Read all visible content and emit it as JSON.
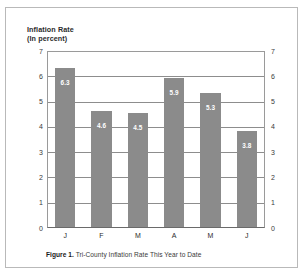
{
  "chart_data": {
    "type": "bar",
    "title": "Inflation Rate",
    "subtitle": "(In percent)",
    "categories": [
      "J",
      "F",
      "M",
      "A",
      "M",
      "J"
    ],
    "values": [
      6.3,
      4.6,
      4.5,
      5.9,
      5.3,
      3.8
    ],
    "value_labels": [
      "6.3",
      "4.6",
      "4.5",
      "5.9",
      "5.3",
      "3.8"
    ],
    "xlabel": "",
    "ylabel": "Inflation Rate (In percent)",
    "ylim": [
      0,
      7
    ],
    "yticks": [
      "0",
      "1",
      "2",
      "3",
      "4",
      "5",
      "6",
      "7"
    ],
    "yticks_right": [
      "0",
      "1",
      "2",
      "3",
      "4",
      "5",
      "6",
      "7"
    ],
    "grid": true,
    "dual_axis": true,
    "legend": "none",
    "bar_color": "#8b8b8b",
    "value_label_color": "#ffffff",
    "grid_color": "#8d8d8d",
    "frame_color": "#b9b9b9",
    "background": "#ffffff"
  },
  "caption": {
    "label": "Figure 1.",
    "text": " Tri-County Inflation Rate This Year to Date"
  }
}
